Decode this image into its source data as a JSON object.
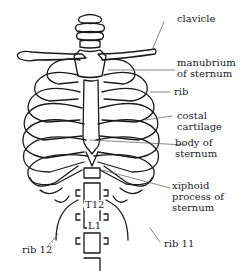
{
  "diagram": {
    "type": "anatomical-illustration",
    "colors": {
      "line": "#1a1a1a",
      "label_text": "#222222",
      "leader": "#555555",
      "background": "#ffffff"
    },
    "labels": {
      "clavicle": "clavicle",
      "manubrium": "manubrium\nof sternum",
      "rib": "rib",
      "costal_cartilage": "costal\ncartilage",
      "body_of_sternum": "body of\nsternum",
      "xiphoid": "xiphoid\nprocess of\nsternum",
      "rib11": "rib 11",
      "rib12": "rib 12",
      "t12": "T12",
      "l1": "L1"
    }
  }
}
